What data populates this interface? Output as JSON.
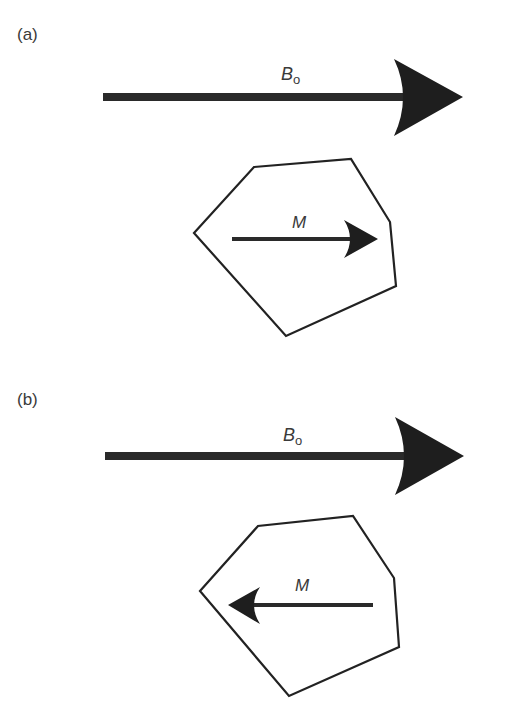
{
  "figure": {
    "panels": [
      {
        "id": "a",
        "label": "(a)",
        "field_vector": {
          "symbol": "B",
          "subscript": "o",
          "direction": "right"
        },
        "magnetization_vector": {
          "symbol": "M",
          "direction": "right",
          "relation": "parallel to B0"
        },
        "grain_shape": "irregular hexagon"
      },
      {
        "id": "b",
        "label": "(b)",
        "field_vector": {
          "symbol": "B",
          "subscript": "o",
          "direction": "right"
        },
        "magnetization_vector": {
          "symbol": "M",
          "direction": "left",
          "relation": "antiparallel to B0"
        },
        "grain_shape": "irregular hexagon"
      }
    ],
    "colors": {
      "background": "#ffffff",
      "arrow": "#1e1e1e",
      "outline": "#222222",
      "text": "#3a3a3a"
    }
  }
}
